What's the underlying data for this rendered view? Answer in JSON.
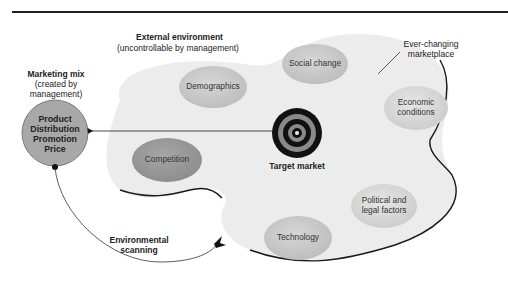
{
  "external_environment": {
    "heading": "External environment",
    "subheading": "(uncontrollable by management)"
  },
  "marketing_mix": {
    "heading": "Marketing mix",
    "sub_line1": "(created by",
    "sub_line2": "management)",
    "items": [
      "Product",
      "Distribution",
      "Promotion",
      "Price"
    ]
  },
  "marketplace_label": {
    "line1": "Ever-changing",
    "line2": "marketplace"
  },
  "target": {
    "label": "Target market"
  },
  "scanning": {
    "line1": "Environmental",
    "line2": "scanning"
  },
  "factors": [
    {
      "id": "demographics",
      "line1": "Demographics",
      "line2": "",
      "shade": "light"
    },
    {
      "id": "social-change",
      "line1": "Social change",
      "line2": "",
      "shade": "light"
    },
    {
      "id": "economic-conditions",
      "line1": "Economic",
      "line2": "conditions",
      "shade": "lighter"
    },
    {
      "id": "competition",
      "line1": "Competition",
      "line2": "",
      "shade": "dark"
    },
    {
      "id": "political-legal",
      "line1": "Political and",
      "line2": "legal factors",
      "shade": "lighter"
    },
    {
      "id": "technology",
      "line1": "Technology",
      "line2": "",
      "shade": "light"
    }
  ],
  "colors": {
    "blob_fill": "#ececec",
    "blob_stroke": "#1a1a1a",
    "oval_light": "#c9c9c9",
    "oval_lighter": "#dadada",
    "oval_dark": "#9a9a9a",
    "mix_circle": "#a8a8a8",
    "target_black": "#111111",
    "target_gray": "#8a8a8a"
  }
}
